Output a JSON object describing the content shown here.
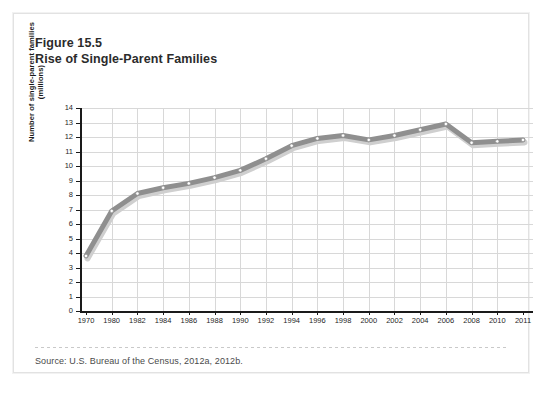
{
  "figure": {
    "number_label": "Figure 15.5",
    "title": "Rise of Single-Parent Families",
    "source": "Source: U.S. Bureau of the Census, 2012a, 2012b."
  },
  "colors": {
    "line": "#8f8f8f",
    "line_shadow": "#cfcfcf",
    "marker_fill": "#ffffff",
    "marker_stroke": "#8f8f8f",
    "grid": "#d8d8d8",
    "axis": "#1a1a1a",
    "card_background": "#ffffff",
    "page_background": "#ffffff"
  },
  "chart_data": {
    "type": "line",
    "title": "Rise of Single-Parent Families",
    "xlabel": "",
    "ylabel": "Number of single-parent families (millions)",
    "ylim": [
      0,
      14
    ],
    "yticks": [
      0,
      1,
      2,
      3,
      4,
      5,
      6,
      7,
      8,
      9,
      10,
      11,
      12,
      13,
      14
    ],
    "grid": true,
    "legend": "none",
    "x": [
      1970,
      1980,
      1982,
      1984,
      1986,
      1988,
      1990,
      1992,
      1994,
      1996,
      1998,
      2000,
      2002,
      2004,
      2006,
      2008,
      2010,
      2011
    ],
    "xtick_labels": [
      "1970",
      "1980",
      "1982",
      "1984",
      "1986",
      "1988",
      "1990",
      "1992",
      "1994",
      "1996",
      "1998",
      "2000",
      "2002",
      "2004",
      "2006",
      "2008",
      "2010",
      "2011"
    ],
    "values": [
      3.8,
      6.9,
      8.1,
      8.5,
      8.8,
      9.2,
      9.7,
      10.5,
      11.4,
      11.9,
      12.1,
      11.8,
      12.1,
      12.5,
      12.9,
      11.6,
      11.7,
      11.8
    ],
    "series": [
      {
        "name": "Number of single-parent families (millions)",
        "values": [
          3.8,
          6.9,
          8.1,
          8.5,
          8.8,
          9.2,
          9.7,
          10.5,
          11.4,
          11.9,
          12.1,
          11.8,
          12.1,
          12.5,
          12.9,
          11.6,
          11.7,
          11.8
        ]
      }
    ]
  }
}
